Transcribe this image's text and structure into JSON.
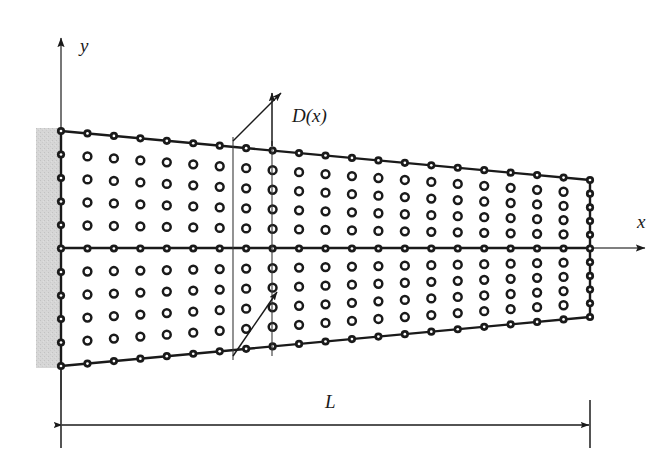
{
  "figure": {
    "type": "engineering-diagram",
    "background": "#ffffff",
    "ink_color": "#1a1a1a",
    "support_fill": "#d4d4d4"
  },
  "axes": {
    "origin": {
      "x": 61,
      "y": 248
    },
    "x_axis": {
      "label": "x",
      "label_pos": {
        "x": 637,
        "y": 228
      },
      "from": {
        "x": 61,
        "y": 248
      },
      "to": {
        "x": 645,
        "y": 248
      },
      "arrow": "end"
    },
    "y_axis": {
      "label": "y",
      "label_pos": {
        "x": 80,
        "y": 52
      },
      "from": {
        "x": 61,
        "y": 400
      },
      "to": {
        "x": 61,
        "y": 38
      },
      "arrow": "end"
    }
  },
  "beam": {
    "left_x": 61,
    "right_x": 590,
    "top_left_y": 131,
    "top_right_y": 180,
    "bottom_left_y": 366,
    "bottom_right_y": 317,
    "columns": 21,
    "interior_rows": 9,
    "midline_row_index": 4
  },
  "support": {
    "name": "fixed-wall",
    "x": 36,
    "y": 128,
    "width": 25,
    "height": 240,
    "fill": "#d4d4d4"
  },
  "annotations": {
    "depth_label": {
      "text": "D(x)",
      "pos": {
        "x": 292,
        "y": 122
      }
    },
    "depth_slice_lines": [
      {
        "x": 233,
        "y1": 137,
        "y2": 360
      },
      {
        "x": 272,
        "y1": 141,
        "y2": 356
      }
    ],
    "depth_arrows": [
      {
        "name": "depth-arrow-upper-diagonal",
        "x1": 233,
        "y1": 141,
        "x2": 281,
        "y2": 93
      },
      {
        "name": "depth-arrow-upper-vertical",
        "x1": 272,
        "y1": 146,
        "x2": 272,
        "y2": 93
      },
      {
        "name": "depth-arrow-lower-diagonal",
        "x1": 233,
        "y1": 356,
        "x2": 277,
        "y2": 292
      }
    ]
  },
  "dimension": {
    "label": "L",
    "label_pos": {
      "x": 325,
      "y": 408
    },
    "line": {
      "x1": 61,
      "x2": 590,
      "y": 425
    },
    "extension_lines": [
      {
        "x": 61,
        "y1": 370,
        "y2": 448
      },
      {
        "x": 590,
        "y1": 400,
        "y2": 448
      }
    ]
  }
}
